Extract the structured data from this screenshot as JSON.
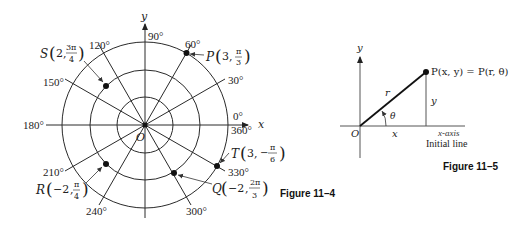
{
  "figures": [
    {
      "caption": "Figure 11–4",
      "axes": {
        "x_label": "x",
        "y_label": "y",
        "origin_label": "O"
      },
      "circles_r_units": [
        1,
        2,
        3
      ],
      "angle_labels": {
        "a0": "0°",
        "a360": "360°",
        "a30": "30°",
        "a60": "60°",
        "a90": "90°",
        "a120": "120°",
        "a150": "150°",
        "a180": "180°",
        "a210": "210°",
        "a240": "240°",
        "a300": "300°",
        "a330": "330°"
      },
      "points": {
        "P": {
          "name": "P",
          "r": "3",
          "theta_num": "π",
          "theta_den": "3",
          "sign": ""
        },
        "S": {
          "name": "S",
          "r": "2",
          "theta_num": "3π",
          "theta_den": "4",
          "sign": ""
        },
        "T": {
          "name": "T",
          "r": "3",
          "theta_num": "π",
          "theta_den": "6",
          "sign": "−"
        },
        "R": {
          "name": "R",
          "r": "−2",
          "theta_num": "π",
          "theta_den": "4",
          "sign": ""
        },
        "Q": {
          "name": "Q",
          "r": "−2",
          "theta_num": "2π",
          "theta_den": "3",
          "sign": ""
        }
      }
    },
    {
      "caption": "Figure 11–5",
      "axes": {
        "x_label": "x",
        "y_label": "y",
        "origin_label": "O"
      },
      "point_label": "P(x, y) = P(r, θ)",
      "r_label": "r",
      "theta_label": "θ",
      "x_label": "x",
      "y_label": "y",
      "xaxis_label": "x-axis",
      "initial_line_label": "Initial line"
    }
  ]
}
